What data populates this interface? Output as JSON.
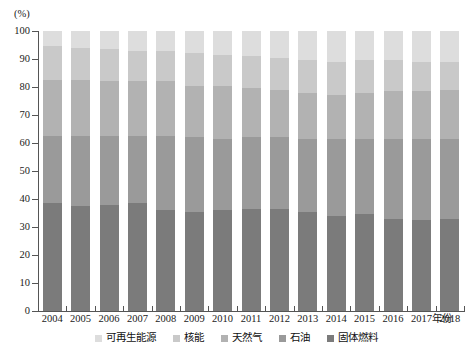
{
  "chart_data": {
    "type": "bar",
    "subtype": "stacked-100-percent",
    "title": "",
    "xlabel": "年份",
    "ylabel": "",
    "unit_label": "(%)",
    "ylim": [
      0,
      100
    ],
    "yticks": [
      0,
      10,
      20,
      30,
      40,
      50,
      60,
      70,
      80,
      90,
      100
    ],
    "grid": false,
    "legend_position": "bottom",
    "categories": [
      "2004",
      "2005",
      "2006",
      "2007",
      "2008",
      "2009",
      "2010",
      "2011",
      "2012",
      "2013",
      "2014",
      "2015",
      "2016",
      "2017",
      "2018"
    ],
    "stack_order_bottom_to_top": [
      "固体燃料",
      "石油",
      "天然气",
      "核能",
      "可再生能源"
    ],
    "series": [
      {
        "name": "固体燃料",
        "color": "#7b7b7b",
        "values": [
          38.5,
          37.5,
          38.0,
          38.5,
          36.0,
          35.5,
          36.0,
          36.5,
          36.5,
          35.5,
          34.0,
          34.5,
          33.0,
          32.5,
          33.0
        ]
      },
      {
        "name": "石油",
        "color": "#9a9a9a",
        "values": [
          24.0,
          25.0,
          24.5,
          24.0,
          26.5,
          26.5,
          25.5,
          25.5,
          25.5,
          26.0,
          27.5,
          27.0,
          28.5,
          29.0,
          28.5
        ]
      },
      {
        "name": "天然气",
        "color": "#b2b2b2",
        "values": [
          20.0,
          20.0,
          19.5,
          19.5,
          19.5,
          18.5,
          19.0,
          17.5,
          17.0,
          16.5,
          15.5,
          16.5,
          17.0,
          17.0,
          17.5
        ]
      },
      {
        "name": "核能",
        "color": "#c9c9c9",
        "values": [
          12.0,
          11.5,
          11.5,
          11.0,
          11.0,
          11.5,
          11.0,
          11.5,
          11.5,
          11.5,
          12.0,
          11.5,
          11.0,
          10.5,
          10.0
        ]
      },
      {
        "name": "可再生能源",
        "color": "#dddddd",
        "values": [
          5.5,
          6.0,
          6.5,
          7.0,
          7.0,
          8.0,
          8.5,
          9.0,
          9.5,
          10.5,
          11.0,
          10.5,
          10.5,
          11.0,
          11.0
        ]
      }
    ]
  },
  "legend": {
    "items": [
      {
        "label": "可再生能源",
        "color": "#dddddd"
      },
      {
        "label": "核能",
        "color": "#c9c9c9"
      },
      {
        "label": "天然气",
        "color": "#b2b2b2"
      },
      {
        "label": "石油",
        "color": "#9a9a9a"
      },
      {
        "label": "固体燃料",
        "color": "#7b7b7b"
      }
    ]
  }
}
